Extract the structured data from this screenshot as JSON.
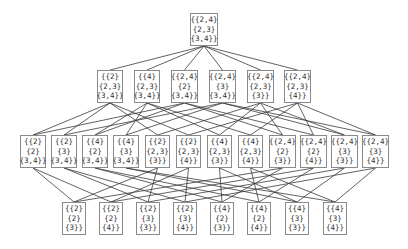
{
  "diagram": {
    "type": "hasse-lattice",
    "rows": [
      {
        "y": 13,
        "h": 33,
        "nodes": [
          {
            "x": 190,
            "w": 28,
            "lines": [
              "{{2,4}",
              "{2,3}",
              "{3,4}}"
            ]
          }
        ]
      },
      {
        "y": 70,
        "h": 33,
        "nodes": [
          {
            "x": 97,
            "w": 26,
            "lines": [
              "{{2}",
              "{2,3}",
              "{3,4}}"
            ]
          },
          {
            "x": 134,
            "w": 26,
            "lines": [
              "{{4}",
              "{2,3}",
              "{3,4}}"
            ]
          },
          {
            "x": 171,
            "w": 27,
            "lines": [
              "{{2,4}",
              "{2}",
              "{3,4}}"
            ]
          },
          {
            "x": 209,
            "w": 27,
            "lines": [
              "{{2,4}",
              "{3}",
              "{3,4}}"
            ]
          },
          {
            "x": 247,
            "w": 27,
            "lines": [
              "{{2,4}",
              "{2,3}",
              "{3}}"
            ]
          },
          {
            "x": 284,
            "w": 27,
            "lines": [
              "{{2,4}",
              "{2,3}",
              "{4}}"
            ]
          }
        ]
      },
      {
        "y": 135,
        "h": 33,
        "nodes": [
          {
            "x": 20,
            "w": 26,
            "lines": [
              "{{2}",
              "{2}",
              "{3,4}}"
            ]
          },
          {
            "x": 51,
            "w": 26,
            "lines": [
              "{{2}",
              "{3}",
              "{3,4}}"
            ]
          },
          {
            "x": 82,
            "w": 26,
            "lines": [
              "{{4}",
              "{2}",
              "{3,4}}"
            ]
          },
          {
            "x": 113,
            "w": 26,
            "lines": [
              "{{4}",
              "{3}",
              "{3,4}}"
            ]
          },
          {
            "x": 145,
            "w": 25,
            "lines": [
              "{{2}",
              "{2,3}",
              "{3}}"
            ]
          },
          {
            "x": 176,
            "w": 25,
            "lines": [
              "{{2}",
              "{2,3}",
              "{4}}"
            ]
          },
          {
            "x": 207,
            "w": 25,
            "lines": [
              "{{4}",
              "{2,3}",
              "{3}}"
            ]
          },
          {
            "x": 238,
            "w": 25,
            "lines": [
              "{{4}",
              "{2,3}",
              "{4}}"
            ]
          },
          {
            "x": 269,
            "w": 27,
            "lines": [
              "{{2,4}",
              "{2}",
              "{3}}"
            ]
          },
          {
            "x": 300,
            "w": 27,
            "lines": [
              "{{2,4}",
              "{2}",
              "{4}}"
            ]
          },
          {
            "x": 331,
            "w": 27,
            "lines": [
              "{{2,4}",
              "{3}",
              "{3}}"
            ]
          },
          {
            "x": 362,
            "w": 27,
            "lines": [
              "{{2,4}",
              "{3}",
              "{4}}"
            ]
          }
        ]
      },
      {
        "y": 202,
        "h": 33,
        "nodes": [
          {
            "x": 62,
            "w": 24,
            "lines": [
              "{{2}",
              "{2}",
              "{3}}"
            ]
          },
          {
            "x": 99,
            "w": 24,
            "lines": [
              "{{2}",
              "{2}",
              "{4}}"
            ]
          },
          {
            "x": 136,
            "w": 24,
            "lines": [
              "{{2}",
              "{3}",
              "{3}}"
            ]
          },
          {
            "x": 173,
            "w": 24,
            "lines": [
              "{{2}",
              "{3}",
              "{4}}"
            ]
          },
          {
            "x": 210,
            "w": 24,
            "lines": [
              "{{4}",
              "{2}",
              "{3}}"
            ]
          },
          {
            "x": 247,
            "w": 24,
            "lines": [
              "{{4}",
              "{2}",
              "{4}}"
            ]
          },
          {
            "x": 285,
            "w": 24,
            "lines": [
              "{{4}",
              "{3}",
              "{3}}"
            ]
          },
          {
            "x": 323,
            "w": 24,
            "lines": [
              "{{4}",
              "{3}",
              "{4}}"
            ]
          }
        ]
      }
    ],
    "edges": [
      [
        [
          0,
          0
        ],
        [
          1,
          0
        ]
      ],
      [
        [
          0,
          0
        ],
        [
          1,
          1
        ]
      ],
      [
        [
          0,
          0
        ],
        [
          1,
          2
        ]
      ],
      [
        [
          0,
          0
        ],
        [
          1,
          3
        ]
      ],
      [
        [
          0,
          0
        ],
        [
          1,
          4
        ]
      ],
      [
        [
          0,
          0
        ],
        [
          1,
          5
        ]
      ],
      [
        [
          1,
          0
        ],
        [
          2,
          0
        ]
      ],
      [
        [
          1,
          0
        ],
        [
          2,
          1
        ]
      ],
      [
        [
          1,
          0
        ],
        [
          2,
          4
        ]
      ],
      [
        [
          1,
          0
        ],
        [
          2,
          5
        ]
      ],
      [
        [
          1,
          1
        ],
        [
          2,
          2
        ]
      ],
      [
        [
          1,
          1
        ],
        [
          2,
          3
        ]
      ],
      [
        [
          1,
          1
        ],
        [
          2,
          6
        ]
      ],
      [
        [
          1,
          1
        ],
        [
          2,
          7
        ]
      ],
      [
        [
          1,
          2
        ],
        [
          2,
          0
        ]
      ],
      [
        [
          1,
          2
        ],
        [
          2,
          2
        ]
      ],
      [
        [
          1,
          2
        ],
        [
          2,
          8
        ]
      ],
      [
        [
          1,
          2
        ],
        [
          2,
          9
        ]
      ],
      [
        [
          1,
          3
        ],
        [
          2,
          1
        ]
      ],
      [
        [
          1,
          3
        ],
        [
          2,
          3
        ]
      ],
      [
        [
          1,
          3
        ],
        [
          2,
          10
        ]
      ],
      [
        [
          1,
          3
        ],
        [
          2,
          11
        ]
      ],
      [
        [
          1,
          4
        ],
        [
          2,
          4
        ]
      ],
      [
        [
          1,
          4
        ],
        [
          2,
          6
        ]
      ],
      [
        [
          1,
          4
        ],
        [
          2,
          8
        ]
      ],
      [
        [
          1,
          4
        ],
        [
          2,
          10
        ]
      ],
      [
        [
          1,
          5
        ],
        [
          2,
          5
        ]
      ],
      [
        [
          1,
          5
        ],
        [
          2,
          7
        ]
      ],
      [
        [
          1,
          5
        ],
        [
          2,
          9
        ]
      ],
      [
        [
          1,
          5
        ],
        [
          2,
          11
        ]
      ],
      [
        [
          2,
          0
        ],
        [
          3,
          0
        ]
      ],
      [
        [
          2,
          0
        ],
        [
          3,
          1
        ]
      ],
      [
        [
          2,
          1
        ],
        [
          3,
          2
        ]
      ],
      [
        [
          2,
          1
        ],
        [
          3,
          3
        ]
      ],
      [
        [
          2,
          2
        ],
        [
          3,
          4
        ]
      ],
      [
        [
          2,
          2
        ],
        [
          3,
          5
        ]
      ],
      [
        [
          2,
          3
        ],
        [
          3,
          6
        ]
      ],
      [
        [
          2,
          3
        ],
        [
          3,
          7
        ]
      ],
      [
        [
          2,
          4
        ],
        [
          3,
          0
        ]
      ],
      [
        [
          2,
          4
        ],
        [
          3,
          2
        ]
      ],
      [
        [
          2,
          5
        ],
        [
          3,
          1
        ]
      ],
      [
        [
          2,
          5
        ],
        [
          3,
          3
        ]
      ],
      [
        [
          2,
          6
        ],
        [
          3,
          4
        ]
      ],
      [
        [
          2,
          6
        ],
        [
          3,
          6
        ]
      ],
      [
        [
          2,
          7
        ],
        [
          3,
          5
        ]
      ],
      [
        [
          2,
          7
        ],
        [
          3,
          7
        ]
      ],
      [
        [
          2,
          8
        ],
        [
          3,
          0
        ]
      ],
      [
        [
          2,
          8
        ],
        [
          3,
          4
        ]
      ],
      [
        [
          2,
          9
        ],
        [
          3,
          1
        ]
      ],
      [
        [
          2,
          9
        ],
        [
          3,
          5
        ]
      ],
      [
        [
          2,
          10
        ],
        [
          3,
          2
        ]
      ],
      [
        [
          2,
          10
        ],
        [
          3,
          6
        ]
      ],
      [
        [
          2,
          11
        ],
        [
          3,
          3
        ]
      ],
      [
        [
          2,
          11
        ],
        [
          3,
          7
        ]
      ]
    ],
    "colors": {
      "edge": "#3a3a3a",
      "border": "#8a8a8a",
      "text": "#333333"
    }
  }
}
